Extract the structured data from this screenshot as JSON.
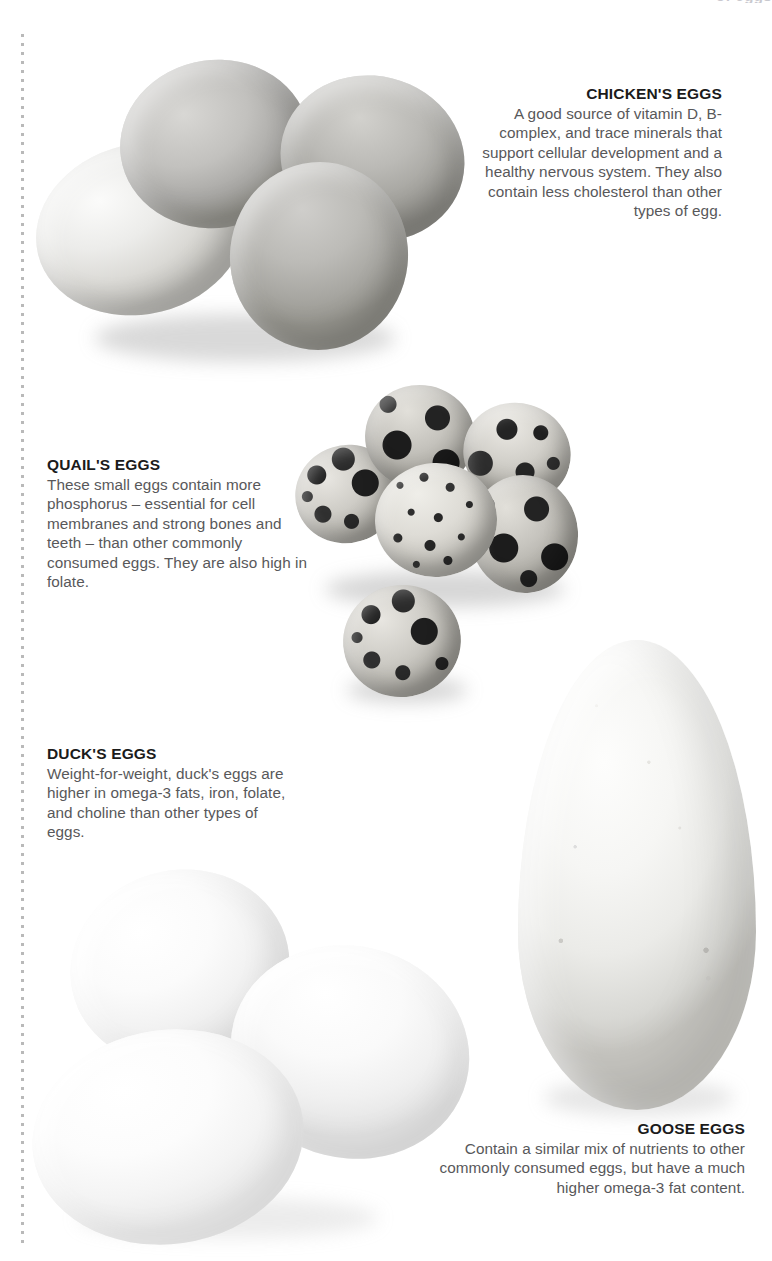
{
  "page": {
    "background_color": "#ffffff",
    "heading_color": "#1b1b1b",
    "body_text_color": "#58585a",
    "rule_color": "#b9b9b9",
    "top_cropped_heading": "of eggs"
  },
  "sections": [
    {
      "id": "chicken",
      "heading": "CHICKEN'S EGGS",
      "body": "A good source of vitamin D, B-complex, and trace minerals that support cellular development and a healthy nervous system. They also contain less cholesterol than other types of egg.",
      "align": "right",
      "image_alt": "four chicken eggs"
    },
    {
      "id": "quail",
      "heading": "QUAIL'S EGGS",
      "body": "These small eggs contain more phosphorus – essential for cell membranes and strong bones and teeth – than other commonly consumed eggs. They are also high in folate.",
      "align": "left",
      "image_alt": "six speckled quail eggs"
    },
    {
      "id": "duck",
      "heading": "DUCK'S EGGS",
      "body": "Weight-for-weight, duck's eggs are higher in omega-3 fats, iron, folate, and choline than other types of eggs.",
      "align": "left",
      "image_alt": "three white duck eggs"
    },
    {
      "id": "goose",
      "heading": "GOOSE EGGS",
      "body": "Contain a similar mix of nutrients to other commonly consumed eggs, but have a much higher omega-3 fat content.",
      "align": "right",
      "image_alt": "one large goose egg"
    }
  ]
}
